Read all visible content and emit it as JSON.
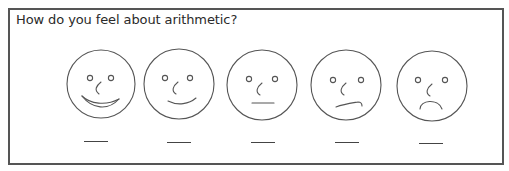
{
  "question": "How do you feel about arithmetic?",
  "scale": {
    "stroke_color": "#555555",
    "line_color": "#444444",
    "items": [
      {
        "id": "very-happy",
        "label": "very happy face",
        "cx": 101,
        "cy": 84,
        "mouth": "big-smile",
        "answer": ""
      },
      {
        "id": "happy",
        "label": "happy face",
        "cx": 179,
        "cy": 84,
        "mouth": "smile",
        "answer": ""
      },
      {
        "id": "neutral",
        "label": "neutral face",
        "cx": 262,
        "cy": 85,
        "mouth": "flat",
        "answer": ""
      },
      {
        "id": "unhappy",
        "label": "unhappy face",
        "cx": 346,
        "cy": 85,
        "mouth": "wry",
        "answer": ""
      },
      {
        "id": "very-unhappy",
        "label": "very unhappy face",
        "cx": 432,
        "cy": 86,
        "mouth": "frown",
        "answer": ""
      }
    ]
  }
}
